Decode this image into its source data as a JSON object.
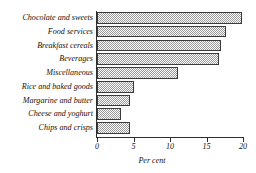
{
  "chart_data": {
    "type": "bar",
    "orientation": "horizontal",
    "title": "",
    "xlabel": "Per cent",
    "ylabel": "",
    "xlim": [
      0,
      20
    ],
    "xticks": [
      0,
      5,
      10,
      15,
      20
    ],
    "xtick_labels": [
      "0",
      "5",
      "10",
      "15",
      "20"
    ],
    "grid": false,
    "legend": null,
    "categories": [
      "Chocolate and sweets",
      "Food services",
      "Breakfast cereals",
      "Beverages",
      "Miscellaneous",
      "Rice and baked goods",
      "Margarine and butter",
      "Cheese and yoghurt",
      "Chips and crisps"
    ],
    "values": [
      19.9,
      17.7,
      17.0,
      16.7,
      11.1,
      5.1,
      4.5,
      3.3,
      4.5
    ],
    "bar_fill": "hatched-grey",
    "bar_edge_color": "#3a3a3a",
    "bar_fill_color": "#9a9a9a",
    "background_color": "#ffffff",
    "axis_color": "#2e2e2e"
  }
}
